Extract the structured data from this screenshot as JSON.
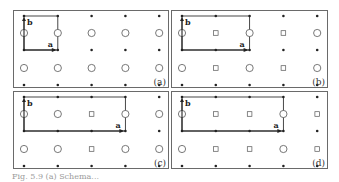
{
  "figure": {
    "panels": [
      {
        "id": "a",
        "label": "(a)",
        "box": {
          "x": 13,
          "y": 10,
          "w": 156,
          "h": 78
        },
        "cell_cols": 1,
        "mid_row": [
          "O",
          "O",
          "O",
          "O",
          "O"
        ]
      },
      {
        "id": "b",
        "label": "(b)",
        "box": {
          "x": 171,
          "y": 10,
          "w": 157,
          "h": 78
        },
        "cell_cols": 2,
        "mid_row": [
          "O",
          "S",
          "O",
          "S",
          "O"
        ]
      },
      {
        "id": "c",
        "label": "(c)",
        "box": {
          "x": 13,
          "y": 91,
          "w": 156,
          "h": 78
        },
        "cell_cols": 3,
        "mid_row": [
          "O",
          "O",
          "S",
          "O",
          "O"
        ]
      },
      {
        "id": "d",
        "label": "(d)",
        "box": {
          "x": 171,
          "y": 91,
          "w": 157,
          "h": 78
        },
        "cell_cols": 3,
        "mid_row": [
          "O",
          "S",
          "S",
          "O",
          "S"
        ]
      }
    ],
    "vector_a_label": "a",
    "vector_b_label": "b",
    "legend_symbols": {
      "O": "open circle",
      "S": "open square",
      "dot": "filled dot"
    },
    "colors": {
      "line": "#333333",
      "frame": "#6a6a6a",
      "symbol": "#555555"
    },
    "caption": "Fig. 5.9  (a) Schema..."
  }
}
